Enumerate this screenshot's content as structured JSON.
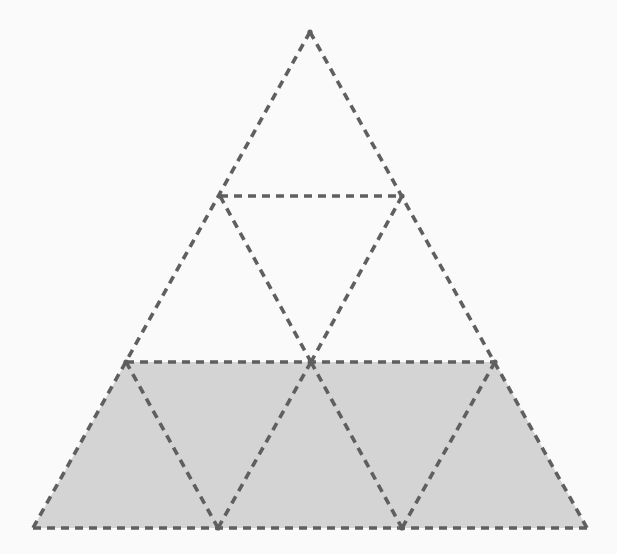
{
  "figure": {
    "name": "subdivided-equilateral-triangle",
    "canvas": {
      "width": 617,
      "height": 554
    },
    "background_color": "#fafafa",
    "line_color": "#5f5f5f",
    "shade_color": "#d4d4d4",
    "stroke_width": 3.6,
    "dash_pattern": "8 6",
    "rows": 3,
    "small_triangle_count": 9,
    "shaded_triangle_count": 5,
    "unshaded_triangle_count": 4,
    "shaded_fraction_label": "5/9"
  },
  "geometry": {
    "apex": {
      "label": "apex",
      "x": 310,
      "y": 32
    },
    "bottom_left": {
      "label": "bottom-left",
      "x": 33,
      "y": 528
    },
    "bottom_right": {
      "label": "bottom-right",
      "x": 587,
      "y": 528
    },
    "row_y": [
      32,
      196,
      362,
      528
    ],
    "vertices": [
      {
        "id": "v0",
        "row": 0,
        "x": 310,
        "y": 32
      },
      {
        "id": "v1",
        "row": 1,
        "x": 220,
        "y": 196
      },
      {
        "id": "v2",
        "row": 1,
        "x": 402,
        "y": 196
      },
      {
        "id": "v3",
        "row": 2,
        "x": 126,
        "y": 362
      },
      {
        "id": "v4",
        "row": 2,
        "x": 311,
        "y": 362
      },
      {
        "id": "v5",
        "row": 2,
        "x": 495,
        "y": 362
      },
      {
        "id": "v6",
        "row": 3,
        "x": 33,
        "y": 528
      },
      {
        "id": "v7",
        "row": 3,
        "x": 218,
        "y": 528
      },
      {
        "id": "v8",
        "row": 3,
        "x": 402,
        "y": 528
      },
      {
        "id": "v9",
        "row": 3,
        "x": 587,
        "y": 528
      }
    ],
    "shaded_polygon_points": "126,362 495,362 587,528 33,528",
    "outer_outline_points": "310,32 587,528 33,528",
    "horizontal_lines": [
      {
        "id": "h-row1",
        "x1": 220,
        "y1": 196,
        "x2": 402,
        "y2": 196
      },
      {
        "id": "h-row2",
        "x1": 126,
        "y1": 362,
        "x2": 495,
        "y2": 362
      },
      {
        "id": "h-base",
        "x1": 33,
        "y1": 528,
        "x2": 587,
        "y2": 528
      }
    ],
    "left_leaning_lines": [
      {
        "id": "l-1",
        "x1": 220,
        "y1": 196,
        "x2": 311,
        "y2": 362
      },
      {
        "id": "l-2",
        "x1": 126,
        "y1": 362,
        "x2": 218,
        "y2": 528
      },
      {
        "id": "l-3",
        "x1": 311,
        "y1": 362,
        "x2": 402,
        "y2": 528
      }
    ],
    "right_leaning_lines": [
      {
        "id": "r-1",
        "x1": 402,
        "y1": 196,
        "x2": 311,
        "y2": 362
      },
      {
        "id": "r-2",
        "x1": 311,
        "y1": 362,
        "x2": 218,
        "y2": 528
      },
      {
        "id": "r-3",
        "x1": 495,
        "y1": 362,
        "x2": 402,
        "y2": 528
      }
    ],
    "outer_edges": [
      {
        "id": "e-left",
        "x1": 310,
        "y1": 32,
        "x2": 33,
        "y2": 528
      },
      {
        "id": "e-right",
        "x1": 310,
        "y1": 32,
        "x2": 587,
        "y2": 528
      }
    ],
    "node_markers": [
      {
        "id": "n-apex",
        "x": 310,
        "y": 32,
        "r": 2.6
      },
      {
        "id": "n-left-mid",
        "x": 220,
        "y": 196,
        "r": 2.6
      },
      {
        "id": "n-right-mid",
        "x": 402,
        "y": 196,
        "r": 2.6
      },
      {
        "id": "n-center",
        "x": 311,
        "y": 362,
        "r": 3.4
      },
      {
        "id": "n-row2-left",
        "x": 126,
        "y": 362,
        "r": 2.6
      },
      {
        "id": "n-row2-right",
        "x": 495,
        "y": 362,
        "r": 2.6
      },
      {
        "id": "n-base-a",
        "x": 218,
        "y": 528,
        "r": 2.6
      },
      {
        "id": "n-base-b",
        "x": 402,
        "y": 528,
        "r": 2.6
      }
    ]
  }
}
